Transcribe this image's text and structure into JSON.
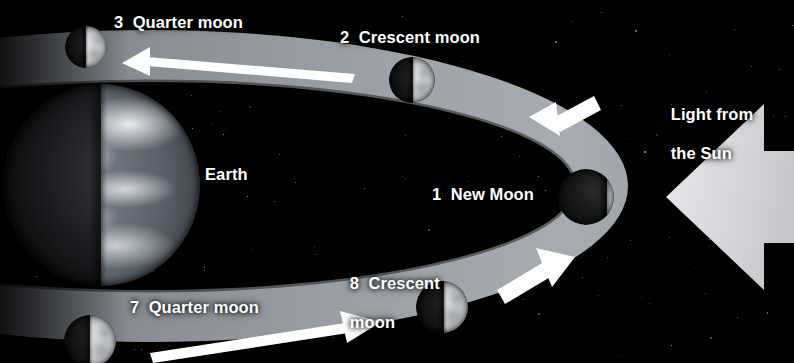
{
  "diagram": {
    "background_color": "#000000",
    "orbit_color": "#9ea3a9",
    "highlight_color": "#ffffff",
    "arrow_color": "#d8dade"
  },
  "labels": {
    "earth": "Earth",
    "sun_light_line1": "Light from",
    "sun_light_line2": "the Sun",
    "moon1": "1  New Moon",
    "moon2": "2  Crescent moon",
    "moon3": "3  Quarter moon",
    "moon7": "7  Quarter moon",
    "moon8_line1": "8  Crescent",
    "moon8_line2": "moon"
  },
  "bodies": [
    {
      "name": "earth",
      "label": "Earth",
      "cx": 101,
      "cy": 185,
      "r": 99,
      "lit_fraction": 0.5
    },
    {
      "name": "moon-1",
      "label": "1  New Moon",
      "phase": "new",
      "cx": 586,
      "cy": 197,
      "r": 28,
      "lit_fraction": 0.12
    },
    {
      "name": "moon-2",
      "label": "2  Crescent moon",
      "phase": "crescent",
      "cx": 412,
      "cy": 80,
      "r": 23,
      "lit_fraction": 0.48
    },
    {
      "name": "moon-3",
      "label": "3  Quarter moon",
      "phase": "quarter",
      "cx": 86,
      "cy": 47,
      "r": 21,
      "lit_fraction": 0.5
    },
    {
      "name": "moon-7",
      "label": "7  Quarter moon",
      "phase": "quarter",
      "cx": 90,
      "cy": 341,
      "r": 26,
      "lit_fraction": 0.5
    },
    {
      "name": "moon-8",
      "label": "8  Crescent moon",
      "phase": "crescent",
      "cx": 442,
      "cy": 307,
      "r": 26,
      "lit_fraction": 0.46
    }
  ],
  "annotations": {
    "orbit_direction": "counterclockwise",
    "top_arrow_direction": "left",
    "bottom_arrow_direction": "right",
    "right_upper_arrow_direction": "up-left",
    "right_lower_arrow_direction": "up-right",
    "sun_arrow_direction": "left"
  }
}
